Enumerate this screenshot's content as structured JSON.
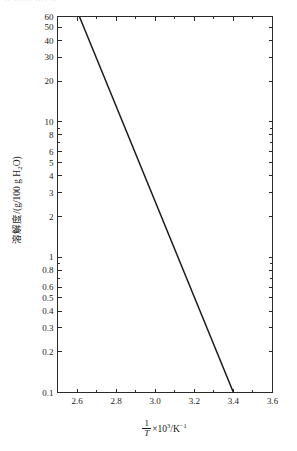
{
  "figure": {
    "top_fragment_text": "·· ··· ·· ···· ··",
    "background_color": "#ffffff",
    "line_color": "#1a1a1a",
    "axis_color": "#2b2b2b"
  },
  "axes": {
    "y_title_main": "溶解度/(g/100 g H",
    "y_title_sub": "2",
    "y_title_tail": "O)",
    "x_title_numerator": "1",
    "x_title_denominator": "T",
    "x_title_tail_pre": "×10",
    "x_title_tail_sup1": "3",
    "x_title_tail_mid": "/K",
    "x_title_tail_sup2": "−1"
  },
  "chart_data": {
    "type": "line",
    "title": "",
    "xlabel": "(1/T)×10³/K⁻¹",
    "ylabel": "溶解度/(g/100 g H2O)",
    "xscale": "linear",
    "yscale": "log",
    "xlim": [
      2.5,
      3.6
    ],
    "ylim": [
      0.1,
      60
    ],
    "grid": false,
    "legend": null,
    "x_major_ticks": [
      2.6,
      2.8,
      3.0,
      3.2,
      3.4,
      3.6
    ],
    "x_major_tick_labels": [
      "2.6",
      "2.8",
      "3.0",
      "3.2",
      "3.4",
      "3.6"
    ],
    "x_minor_ticks": [
      2.5,
      2.7,
      2.9,
      3.1,
      3.3,
      3.5
    ],
    "y_major_ticks": [
      0.1,
      0.2,
      0.3,
      0.4,
      0.5,
      0.6,
      0.8,
      1,
      2,
      3,
      4,
      5,
      6,
      8,
      10,
      20,
      30,
      40,
      50,
      60
    ],
    "y_major_tick_labels": [
      "0.1",
      "0.2",
      "0.3",
      "0.4",
      "0.5",
      "0.6",
      "0.8",
      "1",
      "2",
      "3",
      "4",
      "5",
      "6",
      "8",
      "10",
      "20",
      "30",
      "40",
      "50",
      "60"
    ],
    "y_unlabeled_ticks": [
      0.7,
      0.9,
      7,
      9
    ],
    "series": [
      {
        "name": "solubility",
        "x": [
          2.612,
          2.7,
          2.8,
          2.9,
          3.0,
          3.1,
          3.2,
          3.3,
          3.4
        ],
        "y": [
          60,
          39.3,
          24.2,
          14.9,
          9.2,
          5.65,
          3.48,
          2.14,
          0.1
        ],
        "endpoints": [
          [
            2.612,
            60
          ],
          [
            3.4,
            0.1
          ]
        ],
        "note": "straight line on semi-log axes"
      }
    ]
  }
}
